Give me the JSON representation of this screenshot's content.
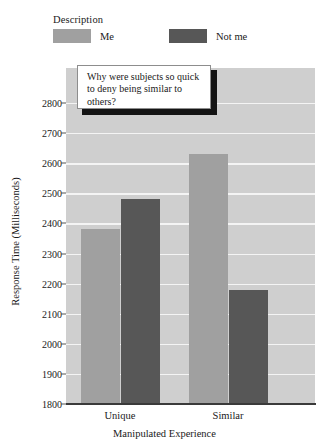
{
  "legend": {
    "title": "Description",
    "entries": [
      {
        "label": "Me",
        "color": "#a0a0a0"
      },
      {
        "label": "Not me",
        "color": "#575757"
      }
    ]
  },
  "callout": {
    "text": "Why were subjects so quick to deny being similar to others?"
  },
  "axes": {
    "y_title": "Response Time (Milliseconds)",
    "x_title": "Manipulated Experience",
    "y_ticks": [
      "1800",
      "1900",
      "2000",
      "2100",
      "2200",
      "2300",
      "2400",
      "2500",
      "2600",
      "2700",
      "2800"
    ],
    "x_categories": [
      "Unique",
      "Similar"
    ]
  },
  "chart_data": {
    "type": "bar",
    "title": "",
    "subtitle": "",
    "xlabel": "Manipulated Experience",
    "ylabel": "Response Time (Milliseconds)",
    "categories": [
      "Unique",
      "Similar"
    ],
    "series": [
      {
        "name": "Me",
        "color": "#a0a0a0",
        "values": [
          2380,
          2630
        ]
      },
      {
        "name": "Not me",
        "color": "#575757",
        "values": [
          2480,
          2180
        ]
      }
    ],
    "ylim": [
      1800,
      2800
    ],
    "ytick_step": 100,
    "grid": true,
    "grid_axis": "y",
    "legend_title": "Description",
    "legend_position": "top-left",
    "annotations": [
      {
        "text": "Why were subjects so quick to deny being similar to others?",
        "type": "callout-box"
      }
    ],
    "plot_background": "#cfcfcf",
    "gridline_color": "#f4f4f4"
  }
}
